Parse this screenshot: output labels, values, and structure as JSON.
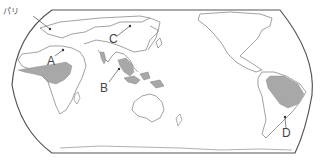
{
  "map": {
    "title": "",
    "projection": "pacific-centered world map",
    "labels": {
      "paris": "パリ",
      "a": "A",
      "b": "B",
      "c": "C",
      "d": "D"
    },
    "shaded_regions": [
      "central-africa",
      "southeast-asia",
      "new-guinea",
      "amazon-basin",
      "india-west-coast",
      "madagascar-east"
    ],
    "colors": {
      "land_fill": "#ffffff",
      "coast_stroke": "#7a7a7a",
      "shaded_fill": "#a8a8a8",
      "frame_stroke": "#555555"
    }
  }
}
